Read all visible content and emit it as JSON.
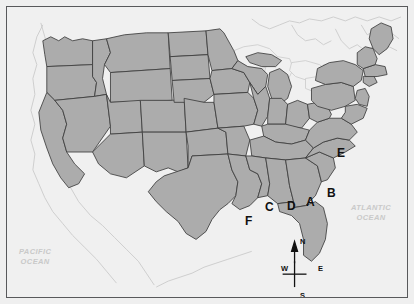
{
  "figure": {
    "kind": "reference-map"
  },
  "colors": {
    "background": "#efefef",
    "frame_border": "#58595b",
    "land_shaded": "#acacac",
    "land_unshaded": "#efefef",
    "state_border": "#3d3d3d",
    "coastline": "#c8c8c8",
    "lake_fill": "#f0f0f0",
    "label_text": "#111111",
    "ocean_label_text": "#c9c9c9"
  },
  "ocean_labels": [
    {
      "name": "pacific-ocean",
      "text": "PACIFIC\nOCEAN"
    },
    {
      "name": "atlantic-ocean",
      "text": "ATLANTIC\nOCEAN"
    }
  ],
  "region_labels": [
    {
      "id": "A",
      "text": "A",
      "x": 299,
      "y": 189
    },
    {
      "id": "B",
      "text": "B",
      "x": 320,
      "y": 180
    },
    {
      "id": "C",
      "text": "C",
      "x": 258,
      "y": 194
    },
    {
      "id": "D",
      "text": "D",
      "x": 280,
      "y": 193
    },
    {
      "id": "E",
      "text": "E",
      "x": 330,
      "y": 140
    },
    {
      "id": "F",
      "text": "F",
      "x": 238,
      "y": 208
    }
  ],
  "compass": {
    "north": "N",
    "south": "S",
    "east": "E",
    "west": "W"
  }
}
